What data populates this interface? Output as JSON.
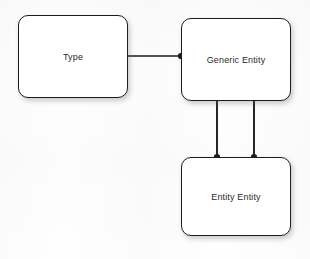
{
  "diagram": {
    "background_color": "#fefefe",
    "line_color": "#1c1c1c",
    "text_color": "#2b2b2b",
    "nodes": [
      {
        "id": "type",
        "label": "Type",
        "shape": "rounded-rectangle",
        "x": 18,
        "y": 15,
        "width": 110,
        "height": 83
      },
      {
        "id": "generic-entity",
        "label": "Generic Entity",
        "shape": "rounded-rectangle",
        "x": 181,
        "y": 18,
        "width": 110,
        "height": 83
      },
      {
        "id": "entity-entity",
        "label": "Entity Entity",
        "shape": "rounded-rectangle",
        "x": 181,
        "y": 157,
        "width": 110,
        "height": 79
      }
    ],
    "edges": [
      {
        "id": "type-to-generic-entity",
        "from": "type",
        "to": "generic-entity",
        "orientation": "horizontal",
        "x1": 128,
        "y1": 56,
        "x2": 181,
        "y2": 56,
        "endpoint_dot_at": "to"
      },
      {
        "id": "generic-entity-to-entity-entity-left",
        "from": "generic-entity",
        "to": "entity-entity",
        "orientation": "vertical",
        "x1": 217,
        "y1": 101,
        "x2": 217,
        "y2": 157,
        "endpoint_dot_at": "to"
      },
      {
        "id": "generic-entity-to-entity-entity-right",
        "from": "generic-entity",
        "to": "entity-entity",
        "orientation": "vertical",
        "x1": 254,
        "y1": 101,
        "x2": 254,
        "y2": 157,
        "endpoint_dot_at": "to"
      }
    ],
    "junction_dots": [
      {
        "id": "dot-generic-entity-left",
        "x": 181,
        "y": 56,
        "radius": 3.1
      },
      {
        "id": "dot-entity-entity-top-left",
        "x": 217,
        "y": 157,
        "radius": 3.1
      },
      {
        "id": "dot-entity-entity-top-right",
        "x": 254,
        "y": 157,
        "radius": 3.1
      }
    ]
  }
}
